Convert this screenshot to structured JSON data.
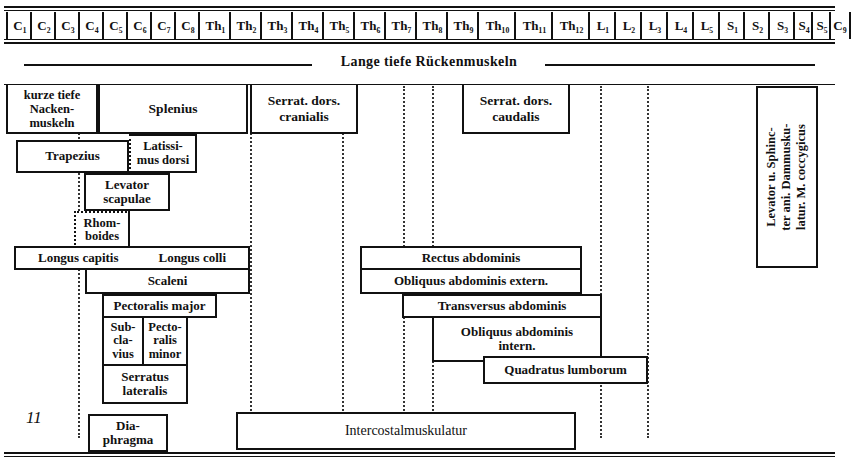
{
  "figure": {
    "page_number": "11",
    "band_label": "Lange tiefe Rückenmuskeln"
  },
  "vertebrae": {
    "cervical": [
      "C₁",
      "C₂",
      "C₃",
      "C₄",
      "C₅",
      "C₆",
      "C₇",
      "C₈"
    ],
    "thoracic": [
      "Th₁",
      "Th₂",
      "Th₃",
      "Th₄",
      "Th₅",
      "Th₆",
      "Th₇",
      "Th₈",
      "Th₉",
      "Th₁₀",
      "Th₁₁",
      "Th₁₂"
    ],
    "lumbar": [
      "L₁",
      "L₂",
      "L₃",
      "L₄",
      "L₅"
    ],
    "sacral": [
      "S₁",
      "S₂",
      "S₃",
      "S₄",
      "S₅"
    ],
    "coccygeal": [
      "C₉"
    ]
  },
  "muscles": {
    "short_deep_neck": "kurze tiefe\nNacken-\nmuskeln",
    "splenius": "Splenius",
    "serratus_dorsalis_cranialis": "Serrat. dors.\ncranialis",
    "serratus_dorsalis_caudalis": "Serrat. dors.\ncaudalis",
    "trapezius": "Trapezius",
    "latissimus_dorsi": "Latissi-\nmus dorsi",
    "levator_scapulae": "Levator\nscapulae",
    "rhomboides": "Rhom-\nboides",
    "longus_capitis": "Longus capitis",
    "longus_colli": "Longus colli",
    "scaleni": "Scaleni",
    "pectoralis_major": "Pectoralis major",
    "subclavius": "Sub-\ncla-\nvius",
    "pectoralis_minor": "Pecto-\nralis\nminor",
    "serratus_lateralis": "Serratus\nlateralis",
    "diaphragma": "Dia-\nphragma",
    "rectus_abdominis": "Rectus abdominis",
    "obliquus_abdominis_externus": "Obliquus abdominis extern.",
    "transversus_abdominis": "Transversus abdominis",
    "obliquus_abdominis_internus": "Obliquus abdominis\nintern.",
    "quadratus_lumborum": "Quadratus lumborum",
    "intercostal": "Intercostalmuskulatur",
    "pelvic_floor_line1": "Levator u. Sphinc-",
    "pelvic_floor_line2": "ter ani. Dammusku-",
    "pelvic_floor_line3": "latur. M. coccygicus"
  },
  "colors": {
    "ink": "#111111",
    "paper": "#ffffff"
  }
}
